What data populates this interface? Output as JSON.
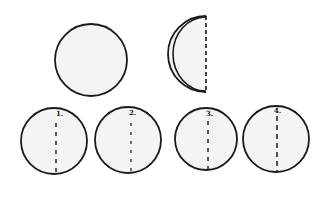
{
  "diagram": {
    "colors": {
      "stroke": "#1a1a1a",
      "fill": "#f4f4f4",
      "background": "#ffffff"
    },
    "top_row": {
      "whole_circle": {
        "cx": 91,
        "cy": 60,
        "r": 36
      },
      "folded_half": {
        "fold_x": 206,
        "cy": 54,
        "r": 38
      }
    },
    "options": [
      {
        "label": "1.",
        "cx": 54,
        "cy": 141,
        "r": 33,
        "fold_x": 56
      },
      {
        "label": "2.",
        "cx": 128,
        "cy": 140,
        "r": 33,
        "fold_x": 131
      },
      {
        "label": "3.",
        "cx": 206,
        "cy": 139,
        "r": 31,
        "fold_x": 208
      },
      {
        "label": "4.",
        "cx": 276,
        "cy": 139,
        "r": 33,
        "fold_x": 277
      }
    ]
  }
}
